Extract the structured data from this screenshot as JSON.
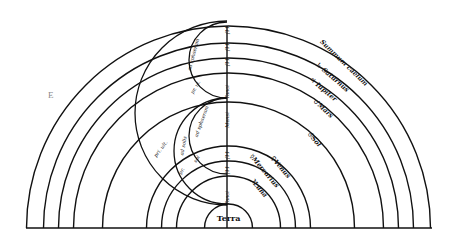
{
  "diagram": {
    "center": {
      "x": 228.5,
      "y": 228
    },
    "baseline": {
      "x1": 26,
      "x2": 432,
      "y": 228
    },
    "corner_letter": "E",
    "terra": {
      "label": "Terra",
      "radius": 24
    },
    "spheres": [
      {
        "name": "Luna",
        "symbol": "☽",
        "label": "☽Luna",
        "radius": 52
      },
      {
        "name": "Mercurius",
        "symbol": "☿",
        "label": "☿Mercurius",
        "radius": 67
      },
      {
        "name": "Venus",
        "symbol": "♀",
        "label": "♀Venus",
        "radius": 82
      },
      {
        "name": "Sol",
        "symbol": "☉",
        "label": "☉Sol",
        "radius": 126
      },
      {
        "name": "Mars",
        "symbol": "♂",
        "label": "♂Mars",
        "radius": 155
      },
      {
        "name": "Jupiter",
        "symbol": "♃",
        "label": "♃ Iupiter",
        "radius": 170
      },
      {
        "name": "Saturnus",
        "symbol": "♄",
        "label": "♄ Saturnus",
        "radius": 185
      },
      {
        "name": "Summum caelum",
        "symbol": "",
        "label": "Summum caelum",
        "radius": 202
      }
    ],
    "axis": {
      "x": 227,
      "y1": 26,
      "y2": 228
    },
    "epicycles": [
      {
        "name": "upper-small",
        "cx": 227,
        "cy": 60,
        "r": 38
      },
      {
        "name": "large",
        "cx": 227,
        "cy": 113,
        "r": 92
      },
      {
        "name": "crescent-inner",
        "cx": 227,
        "cy": 136,
        "r": 38
      },
      {
        "name": "crescent-outer",
        "cx": 227,
        "cy": 151,
        "r": 53
      }
    ],
    "epicycle_labels": [
      {
        "text": "ad sphaeram",
        "x": 195,
        "y": 55,
        "rotate": -75
      },
      {
        "text": "pr. ul.",
        "x": 197,
        "y": 88,
        "rotate": -60
      },
      {
        "text": "ad sphaeram",
        "x": 203,
        "y": 122,
        "rotate": -70
      },
      {
        "text": "ad solis",
        "x": 185,
        "y": 146,
        "rotate": -80
      },
      {
        "text": "pri. ult.",
        "x": 162,
        "y": 150,
        "rotate": -52
      },
      {
        "text": "sol",
        "x": 198,
        "y": 160,
        "rotate": -55
      },
      {
        "text": "pr.",
        "x": 183,
        "y": 172,
        "rotate": -60
      }
    ],
    "axis_ticks": [
      {
        "text": "ſ11",
        "y": 30
      },
      {
        "text": "ſ11",
        "y": 47
      },
      {
        "text": "ſ11",
        "y": 62
      },
      {
        "text": "Tanci",
        "y": 92
      },
      {
        "text": "Mensi",
        "y": 120
      },
      {
        "text": "ſ11",
        "y": 155
      },
      {
        "text": "ſ11",
        "y": 170
      },
      {
        "text": "Tanci",
        "y": 198
      }
    ]
  }
}
